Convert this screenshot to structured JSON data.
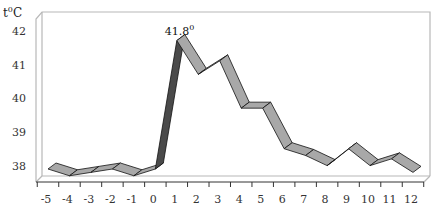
{
  "chart_data": {
    "type": "line",
    "style": "3d-ribbon",
    "title": "",
    "xlabel": "",
    "ylabel": "t⁰C",
    "y_unit_label": "t",
    "y_unit_sup": "0",
    "y_unit_suffix": "C",
    "x": [
      -5,
      -4,
      -3,
      -2,
      -1,
      0,
      1,
      2,
      3,
      4,
      5,
      6,
      7,
      8,
      9,
      10,
      11,
      12
    ],
    "x_tick_labels": [
      "-5",
      "-4",
      "-3",
      "-2",
      "-1",
      "0",
      "1",
      "2",
      "3",
      "4",
      "5",
      "6",
      "7",
      "8",
      "9",
      "10",
      "11",
      "12"
    ],
    "series": [
      {
        "name": "Temperature",
        "values": [
          38.0,
          37.8,
          37.9,
          38.0,
          37.8,
          38.0,
          41.8,
          40.8,
          41.2,
          39.8,
          39.8,
          38.6,
          38.4,
          38.1,
          38.6,
          38.1,
          38.3,
          37.9
        ]
      }
    ],
    "y_ticks": [
      38,
      39,
      40,
      41,
      42
    ],
    "y_tick_labels": [
      "38",
      "39",
      "40",
      "41",
      "42"
    ],
    "ylim": [
      37.5,
      42.3
    ],
    "annotations": [
      {
        "x": 1,
        "y": 41.8,
        "text": "41.8",
        "sup": "0"
      }
    ],
    "grid": false,
    "legend": "none",
    "colors": {
      "ribbon_face": "#a8a8a8",
      "ribbon_dark": "#4a4a4a",
      "outline": "#111111",
      "frame": "#b8b8b8"
    }
  }
}
